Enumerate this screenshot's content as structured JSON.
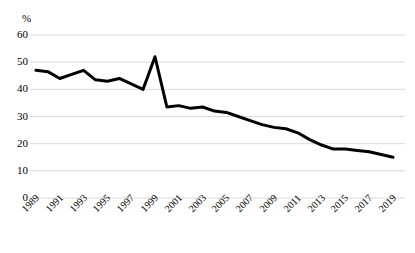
{
  "chart_data": {
    "type": "line",
    "title": "",
    "subtitle": "",
    "xlabel": "",
    "ylabel": "%",
    "unit_label": "%",
    "xlim": [
      1989,
      2019
    ],
    "ylim": [
      0,
      60
    ],
    "yticks": [
      60,
      50,
      40,
      30,
      20,
      10,
      0
    ],
    "ytick_labels": [
      "60",
      "50",
      "40",
      "30",
      "20",
      "10",
      "0"
    ],
    "xticks": [
      1989,
      1991,
      1993,
      1995,
      1997,
      1999,
      2001,
      2003,
      2005,
      2007,
      2009,
      2011,
      2013,
      2015,
      2017,
      2019
    ],
    "xtick_labels": [
      "1989",
      "1991",
      "1993",
      "1995",
      "1997",
      "1999",
      "2001",
      "2003",
      "2005",
      "2007",
      "2009",
      "2011",
      "2013",
      "2015",
      "2017",
      "2019"
    ],
    "grid": true,
    "grid_axis": "y",
    "grid_color": "#d9d9d9",
    "legend": false,
    "legend_position": "none",
    "line_color": "#000000",
    "line_width": 3,
    "markers": false,
    "x": [
      1989,
      1990,
      1991,
      1992,
      1993,
      1994,
      1995,
      1996,
      1997,
      1998,
      1999,
      2000,
      2001,
      2002,
      2003,
      2004,
      2005,
      2006,
      2007,
      2008,
      2009,
      2010,
      2011,
      2012,
      2013,
      2014,
      2015,
      2016,
      2017,
      2018,
      2019
    ],
    "series": [
      {
        "name": "value",
        "values": [
          47.0,
          46.5,
          44.0,
          45.5,
          47.0,
          43.5,
          43.0,
          44.0,
          42.0,
          40.0,
          52.0,
          33.5,
          34.0,
          33.0,
          33.5,
          32.0,
          31.5,
          30.0,
          28.5,
          27.0,
          26.0,
          25.5,
          24.0,
          21.5,
          19.5,
          18.0,
          18.0,
          17.5,
          17.0,
          16.0,
          15.0
        ]
      }
    ]
  }
}
